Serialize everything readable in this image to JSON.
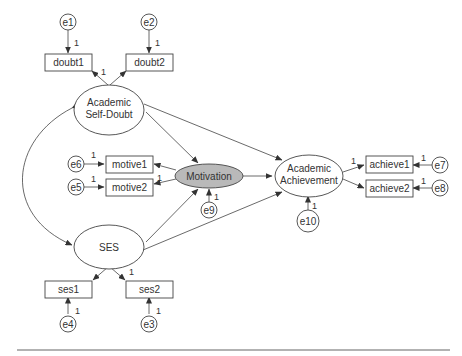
{
  "diagram": {
    "type": "structural-equation-model",
    "latent": {
      "self_doubt": [
        "Academic",
        "Self-Doubt"
      ],
      "ses": "SES",
      "motivation": "Motivation",
      "achievement": [
        "Academic",
        "Achievement"
      ]
    },
    "observed": {
      "doubt1": "doubt1",
      "doubt2": "doubt2",
      "motive1": "motive1",
      "motive2": "motive2",
      "achieve1": "achieve1",
      "achieve2": "achieve2",
      "ses1": "ses1",
      "ses2": "ses2"
    },
    "errors": {
      "e1": "e1",
      "e2": "e2",
      "e3": "e3",
      "e4": "e4",
      "e5": "e5",
      "e6": "e6",
      "e7": "e7",
      "e8": "e8",
      "e9": "e9",
      "e10": "e10"
    },
    "path_weight": "1",
    "colors": {
      "motivation_fill": "#b9b9b9",
      "stroke": "#444444"
    }
  }
}
